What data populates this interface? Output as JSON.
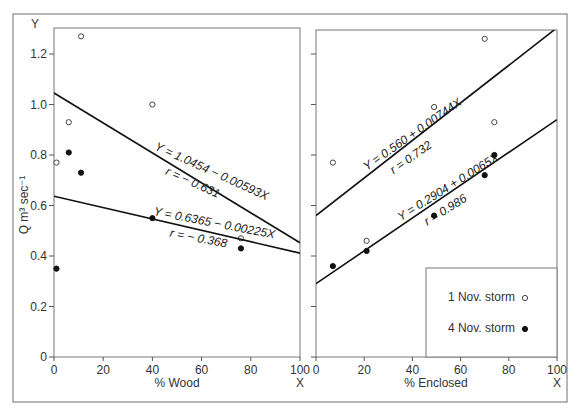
{
  "figure": {
    "y_axis_letter": "Y",
    "y_axis_label": "Q  m³ sec⁻¹",
    "legend": {
      "items": [
        {
          "label": "1 Nov. storm",
          "marker": "open-circle"
        },
        {
          "label": "4 Nov. storm",
          "marker": "filled-circle"
        }
      ]
    }
  },
  "chart_data": [
    {
      "type": "scatter",
      "title": "",
      "xlabel": "% Wood",
      "x_axis_letter": "X",
      "ylabel": "Q m³ sec⁻¹",
      "xlim": [
        0,
        100
      ],
      "ylim": [
        0,
        1.3
      ],
      "xticks": [
        "0",
        "20",
        "40",
        "60",
        "80",
        "100"
      ],
      "yticks": [
        "0",
        "0.2",
        "0.4",
        "0.6",
        "0.8",
        "1.0",
        "1.2"
      ],
      "grid": false,
      "series": [
        {
          "name": "1 Nov. storm",
          "marker": "open-circle",
          "points": [
            [
              1,
              0.77
            ],
            [
              6,
              0.93
            ],
            [
              11,
              1.27
            ],
            [
              40,
              1.0
            ],
            [
              76,
              0.47
            ]
          ],
          "regression": {
            "equation": "Y = 1.0454 − 0.00593X",
            "r": "r = − 0.631",
            "intercept": 1.0454,
            "slope": -0.00593
          }
        },
        {
          "name": "4 Nov. storm",
          "marker": "filled-circle",
          "points": [
            [
              1,
              0.35
            ],
            [
              6,
              0.81
            ],
            [
              11,
              0.73
            ],
            [
              40,
              0.55
            ],
            [
              76,
              0.43
            ]
          ],
          "regression": {
            "equation": "Y = 0.6365 − 0.00225X",
            "r": "r = − 0.368",
            "intercept": 0.6365,
            "slope": -0.00225
          }
        }
      ]
    },
    {
      "type": "scatter",
      "title": "",
      "xlabel": "% Enclosed",
      "x_axis_letter": "X",
      "ylabel": "",
      "xlim": [
        0,
        100
      ],
      "ylim": [
        0,
        1.3
      ],
      "xticks": [
        "0",
        "20",
        "40",
        "60",
        "80",
        "100"
      ],
      "yticks": [],
      "grid": false,
      "legend_position": "lower right",
      "series": [
        {
          "name": "1 Nov. storm",
          "marker": "open-circle",
          "points": [
            [
              7,
              0.77
            ],
            [
              21,
              0.46
            ],
            [
              49,
              0.99
            ],
            [
              70,
              1.26
            ],
            [
              74,
              0.93
            ]
          ],
          "regression": {
            "equation": "Y = 0.560 + 0.00744X",
            "r": "r = 0.732",
            "intercept": 0.56,
            "slope": 0.00744
          }
        },
        {
          "name": "4 Nov. storm",
          "marker": "filled-circle",
          "points": [
            [
              7,
              0.36
            ],
            [
              21,
              0.42
            ],
            [
              49,
              0.56
            ],
            [
              70,
              0.72
            ],
            [
              74,
              0.8
            ]
          ],
          "regression": {
            "equation": "Y = 0.2904 + 0.0065X",
            "r": "r = 0.986",
            "intercept": 0.2904,
            "slope": 0.0065
          }
        }
      ]
    }
  ]
}
